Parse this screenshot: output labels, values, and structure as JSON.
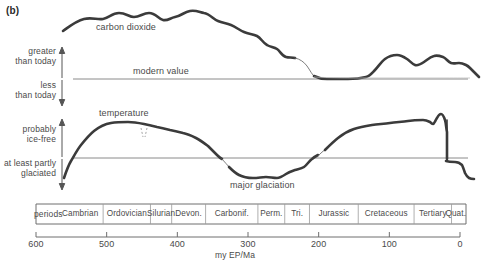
{
  "figure": {
    "panel_label": "(b)",
    "unit_label": "my EP/Ma",
    "periods_word": "periods"
  },
  "curves": [
    {
      "id": "carbon-dioxide",
      "label": "carbon dioxide",
      "label_x": 96,
      "label_y": 27
    },
    {
      "id": "temperature",
      "label": "temperature",
      "label_x": 99,
      "label_y": 113
    }
  ],
  "annotations": [
    {
      "id": "modern-value",
      "label": "modern value",
      "x": 133,
      "y": 70
    },
    {
      "id": "major-glaciation",
      "label": "major glaciation",
      "x": 230,
      "y": 183
    }
  ],
  "axis_captions": [
    {
      "id": "greater-than-today",
      "line1": "greater",
      "line2": "than today",
      "x": 6,
      "y": 48,
      "width": 46
    },
    {
      "id": "less-than-today",
      "line1": "less",
      "line2": "than today",
      "x": 6,
      "y": 82,
      "width": 46
    },
    {
      "id": "probably-ice-free",
      "line1": "probably",
      "line2": "ice-free",
      "x": 6,
      "y": 125,
      "width": 46
    },
    {
      "id": "at-least-partly-glaciated",
      "line1": "at least partly",
      "line2": "glaciated",
      "x": 0,
      "y": 160,
      "width": 52
    }
  ],
  "periods": [
    {
      "name": "Cambrian",
      "start_ma": 570,
      "end_ma": 505
    },
    {
      "name": "Ordovician",
      "start_ma": 505,
      "end_ma": 438
    },
    {
      "name": "Silurian",
      "start_ma": 438,
      "end_ma": 408
    },
    {
      "name": "Devon.",
      "start_ma": 408,
      "end_ma": 360
    },
    {
      "name": "Carbonif.",
      "start_ma": 360,
      "end_ma": 286
    },
    {
      "name": "Perm.",
      "start_ma": 286,
      "end_ma": 248
    },
    {
      "name": "Tri.",
      "start_ma": 248,
      "end_ma": 213
    },
    {
      "name": "Jurassic",
      "start_ma": 213,
      "end_ma": 144
    },
    {
      "name": "Cretaceous",
      "start_ma": 144,
      "end_ma": 65
    },
    {
      "name": "Tertiary",
      "start_ma": 65,
      "end_ma": 12
    },
    {
      "name": "Quat.",
      "start_ma": 12,
      "end_ma": 0
    }
  ],
  "x_ticks": [
    {
      "value": "600",
      "ma": 600
    },
    {
      "value": "500",
      "ma": 500
    },
    {
      "value": "400",
      "ma": 400
    },
    {
      "value": "300",
      "ma": 300
    },
    {
      "value": "200",
      "ma": 200
    },
    {
      "value": "100",
      "ma": 100
    },
    {
      "value": "0",
      "ma": 0
    }
  ],
  "colors": {
    "curve": "#3b3b3b",
    "baseline": "#8a8a8a",
    "axis": "#6e6e6e",
    "text": "#4a4a4a",
    "background": "#ffffff"
  },
  "chart_data": {
    "type": "line",
    "title": "",
    "xlabel": "my EP/Ma",
    "ylabel": "",
    "xlim": [
      600,
      0
    ],
    "grid": false,
    "legend": "inline-labels",
    "series": [
      {
        "name": "carbon dioxide",
        "units": "relative to modern value",
        "baseline_label": "modern value",
        "x": [
          570,
          555,
          540,
          525,
          510,
          495,
          480,
          465,
          450,
          435,
          420,
          405,
          390,
          375,
          360,
          345,
          330,
          315,
          300,
          290,
          280,
          265,
          250,
          235,
          220,
          205,
          190,
          175,
          160,
          145,
          130,
          115,
          100,
          85,
          70,
          55,
          40,
          25,
          10,
          0
        ],
        "y": [
          2.4,
          2.9,
          3.3,
          3.5,
          3.6,
          3.9,
          3.7,
          3.8,
          4.0,
          3.8,
          4.1,
          4.2,
          3.9,
          3.4,
          3.1,
          3.0,
          2.9,
          2.2,
          2.1,
          1.6,
          1.5,
          0.55,
          0.4,
          0.3,
          0.35,
          0.5,
          1.1,
          1.5,
          1.35,
          1.25,
          1.5,
          1.2,
          0.9,
          0.85,
          0.75,
          0.8,
          0.7,
          0.6,
          0.45,
          0.3
        ],
        "dashed_segments": [
          [
            290,
            258
          ]
        ],
        "note": "relative CO2, 0 = modern value baseline; falls below-ish to modern by Tertiary"
      },
      {
        "name": "temperature",
        "units": "relative warmth",
        "baseline_label": "glaciation threshold",
        "x": [
          570,
          560,
          550,
          540,
          525,
          510,
          495,
          480,
          465,
          450,
          435,
          420,
          405,
          390,
          375,
          360,
          350,
          340,
          330,
          320,
          310,
          300,
          290,
          280,
          265,
          250,
          235,
          220,
          205,
          190,
          175,
          160,
          145,
          130,
          115,
          100,
          85,
          70,
          60,
          50,
          45,
          40,
          35,
          30,
          20,
          10,
          5,
          0
        ],
        "y": [
          -1.6,
          -1.2,
          -0.3,
          0.6,
          1.3,
          1.6,
          1.75,
          1.8,
          1.7,
          1.65,
          1.6,
          1.5,
          1.4,
          1.3,
          1.1,
          0.6,
          0.1,
          -0.4,
          -0.8,
          -1.1,
          -1.25,
          -1.3,
          -1.25,
          -1.2,
          -1.1,
          -0.95,
          -0.75,
          -0.4,
          0.1,
          0.6,
          1.0,
          1.25,
          1.4,
          1.5,
          1.55,
          1.6,
          1.6,
          1.55,
          1.8,
          1.7,
          1.9,
          1.75,
          -0.15,
          -0.2,
          -0.35,
          -0.9,
          -1.05,
          -0.85
        ],
        "dashed_segments": [
          [
            360,
            345
          ],
          [
            40,
            36
          ]
        ],
        "annotation": "major glaciation",
        "note": "above baseline = probably ice-free; below baseline = at least partly glaciated"
      }
    ]
  }
}
